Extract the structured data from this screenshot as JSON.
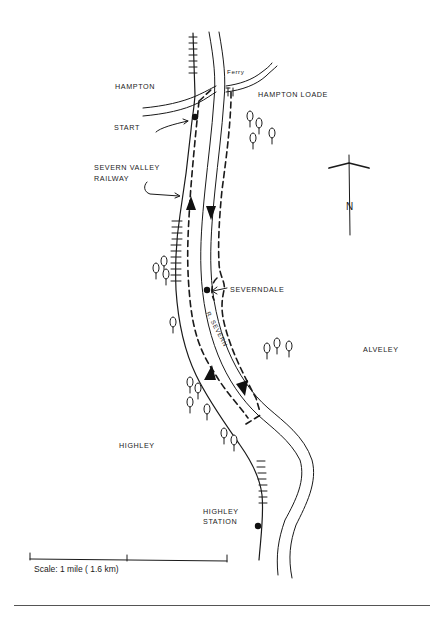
{
  "map": {
    "title": "Hampton Loade to Highley walk",
    "labels": {
      "hampton": "HAMPTON",
      "ferry": "Ferry",
      "hampton_loade": "HAMPTON LOADE",
      "start": "START",
      "railway_line1": "SEVERN VALLEY",
      "railway_line2": "RAILWAY",
      "severndale": "SEVERNDALE",
      "river": "R. SEVERN",
      "alveley": "ALVELEY",
      "highley": "HIGHLEY",
      "highley_station_line1": "HIGHLEY",
      "highley_station_line2": "STATION"
    },
    "north_arrow": {
      "label": "N"
    },
    "scale": {
      "label": "Scale: 1 mile ( 1.6 km)"
    },
    "colors": {
      "ink": "#1a1a1a",
      "background": "#ffffff"
    }
  }
}
